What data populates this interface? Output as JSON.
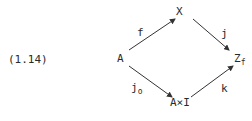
{
  "equation_number": "(1.14)",
  "nodes": {
    "A": "A",
    "X": "X",
    "Z": {
      "base": "Z",
      "sub": "f"
    },
    "AxI": "A×I"
  },
  "arrows": {
    "f": {
      "label": "f",
      "from": "A",
      "to": "X"
    },
    "j": {
      "label": "j",
      "from": "X",
      "to": "Z_f"
    },
    "j0": {
      "label": {
        "base": "j",
        "sub": "o"
      },
      "from": "A",
      "to": "A×I"
    },
    "k": {
      "label": "k",
      "from": "A×I",
      "to": "Z_f"
    }
  }
}
